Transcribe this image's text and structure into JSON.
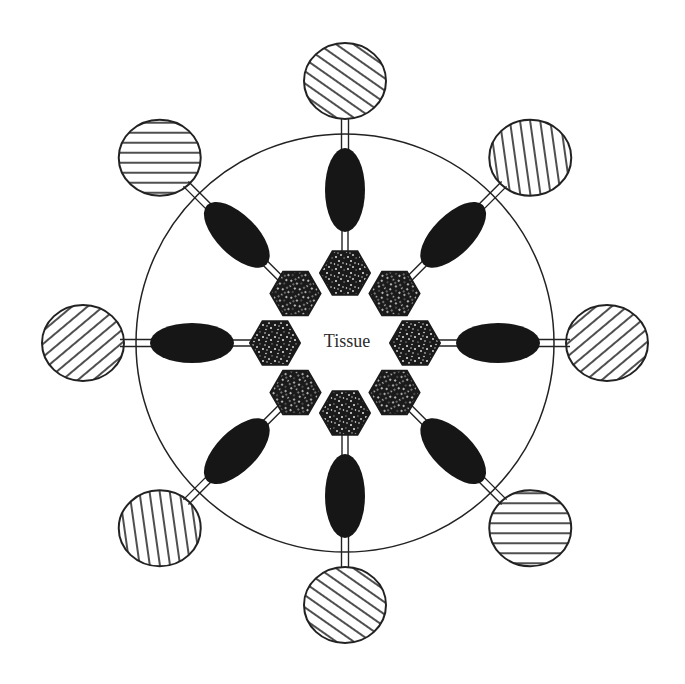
{
  "diagram": {
    "center_label": "Tissue",
    "tissue_circle": {
      "cx": 345,
      "cy": 343,
      "r": 209,
      "stroke": "#222222"
    },
    "colors": {
      "ink": "#161616",
      "stroke": "#222222",
      "background": "#ffffff",
      "speckle": "#e6e6e6"
    },
    "units": [
      {
        "id": "n",
        "angle": -90,
        "hatch": "diagonal-down"
      },
      {
        "id": "ne",
        "angle": -45,
        "hatch": "vertical"
      },
      {
        "id": "e",
        "angle": 0,
        "hatch": "diagonal-up"
      },
      {
        "id": "se",
        "angle": 45,
        "hatch": "horizontal"
      },
      {
        "id": "s",
        "angle": 90,
        "hatch": "diagonal-down"
      },
      {
        "id": "sw",
        "angle": 135,
        "hatch": "vertical"
      },
      {
        "id": "w",
        "angle": 180,
        "hatch": "diagonal-up"
      },
      {
        "id": "nw",
        "angle": -135,
        "hatch": "horizontal"
      }
    ],
    "components": {
      "outer_circle": "hatched-circle",
      "linker": "double-line-linker",
      "body": "black-ellipse",
      "core": "speckled-hexagon"
    }
  }
}
